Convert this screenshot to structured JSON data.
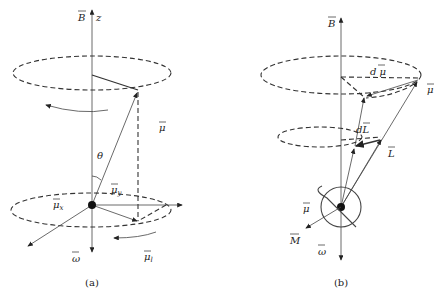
{
  "figure": {
    "panel_a": {
      "caption": "(a)",
      "labels": {
        "B": "B",
        "z": "z",
        "mu": "μ",
        "theta": "θ",
        "mu_y": "μ",
        "mu_y_sub": "y",
        "mu_x": "μ",
        "mu_x_sub": "x",
        "omega": "ω",
        "mu_l": "μ",
        "mu_l_sub": "l"
      }
    },
    "panel_b": {
      "caption": "(b)",
      "labels": {
        "B": "B",
        "d_mu": "d μ",
        "mu_top": "μ",
        "d_L": "dL",
        "L": "L",
        "mu_left": "μ",
        "M": "M",
        "omega": "ω"
      }
    },
    "colors": {
      "line": "#333333",
      "background": "#ffffff"
    }
  }
}
